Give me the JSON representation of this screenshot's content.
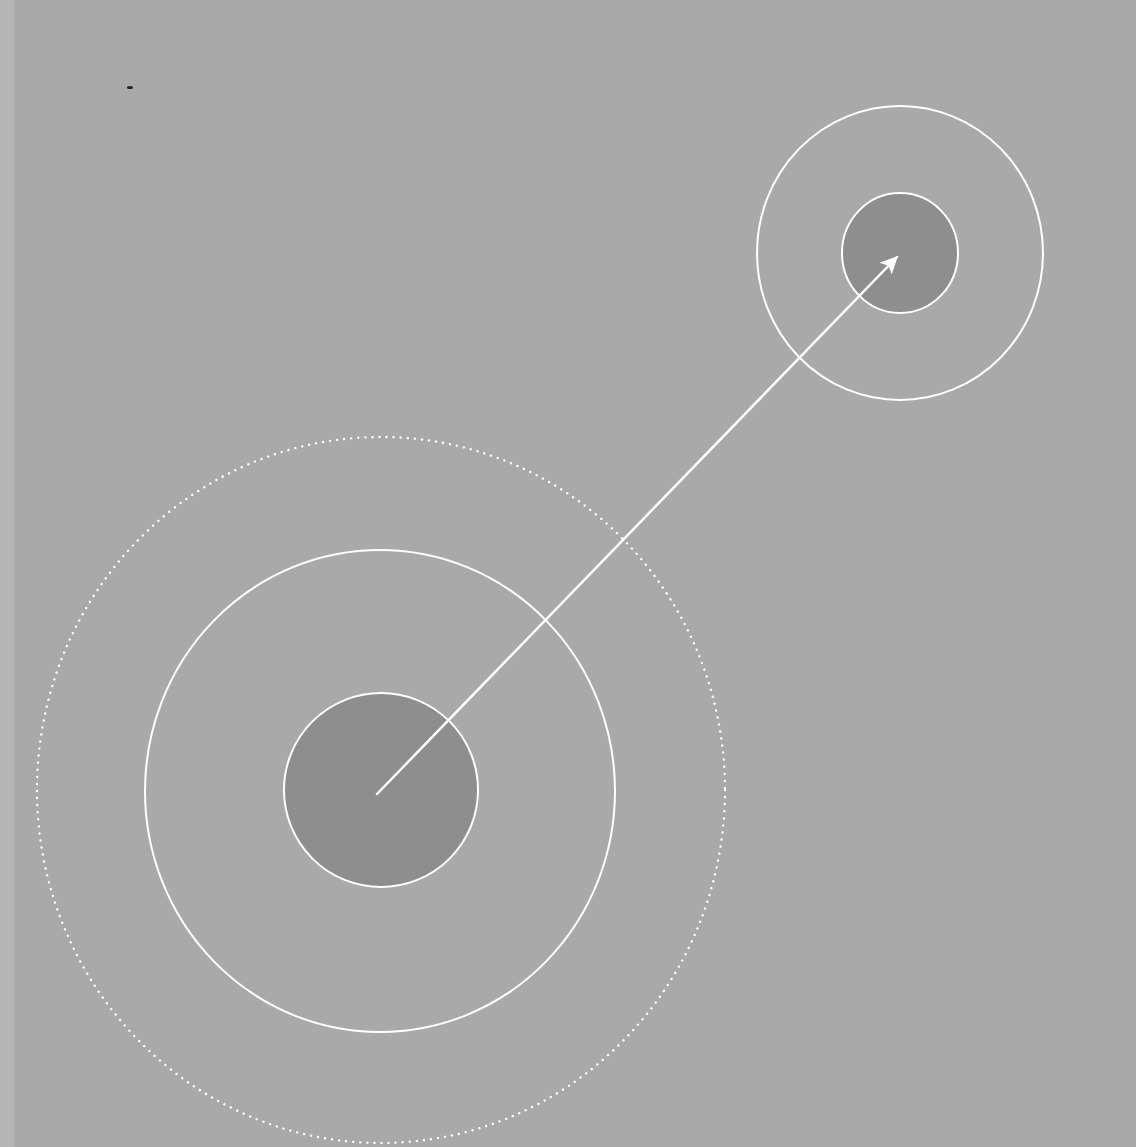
{
  "diagram": {
    "colors": {
      "background": "#a9a9a9",
      "left_strip": "#b5b5b5",
      "disc_fill": "#8e8e8e",
      "stroke": "#ffffff",
      "speck": "#222222"
    },
    "source_target": {
      "center": [
        381,
        790
      ],
      "inner_disc_radius": 97,
      "middle_ring_radius": [
        235,
        241
      ],
      "outer_dotted_ring_radius": [
        344,
        353
      ]
    },
    "destination_target": {
      "center": [
        900,
        253
      ],
      "inner_disc_radius": [
        58,
        60
      ],
      "outer_ring_radius": [
        143,
        147
      ]
    },
    "arrow": {
      "from": [
        377,
        794
      ],
      "to": [
        900,
        254
      ],
      "stroke_width": 2.5,
      "head_length": 16
    }
  }
}
